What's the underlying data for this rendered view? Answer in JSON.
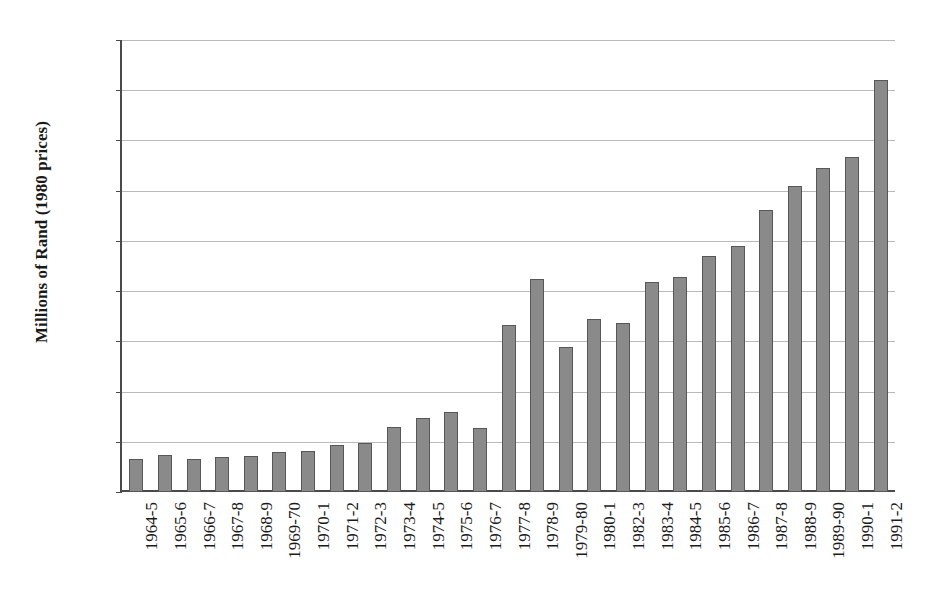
{
  "chart_data": {
    "type": "bar",
    "title": "",
    "subtitle": "",
    "xlabel": "",
    "ylabel": "Millions of Rand (1980 prices)",
    "ylim": [
      0,
      900
    ],
    "ytick_step": 100,
    "yticks": [
      "900",
      "800",
      "700",
      "600",
      "500",
      "400",
      "300",
      "200",
      "100",
      "0"
    ],
    "grid": true,
    "legend": false,
    "legend_position": "none",
    "bar_color": "#8a8a8a",
    "bar_edge_color": "#575757",
    "axis_color": "#4a4a4a",
    "gridline_color": "#b9b9b9",
    "background_color": "#ffffff",
    "categories": [
      "1964-5",
      "1965-6",
      "1966-7",
      "1967-8",
      "1968-9",
      "1969-70",
      "1970-1",
      "1971-2",
      "1972-3",
      "1973-4",
      "1974-5",
      "1975-6",
      "1976-7",
      "1977-8",
      "1978-9",
      "1979-80",
      "1980-1",
      "1982-3",
      "1983-4",
      "1984-5",
      "1985-6",
      "1986-7",
      "1987-8",
      "1988-9",
      "1989-90",
      "1990-1",
      "1991-2"
    ],
    "values": [
      66,
      74,
      65,
      70,
      71,
      79,
      82,
      94,
      98,
      130,
      148,
      160,
      127,
      333,
      425,
      288,
      345,
      337,
      418,
      428,
      470,
      490,
      562,
      610,
      645,
      667,
      820
    ]
  }
}
